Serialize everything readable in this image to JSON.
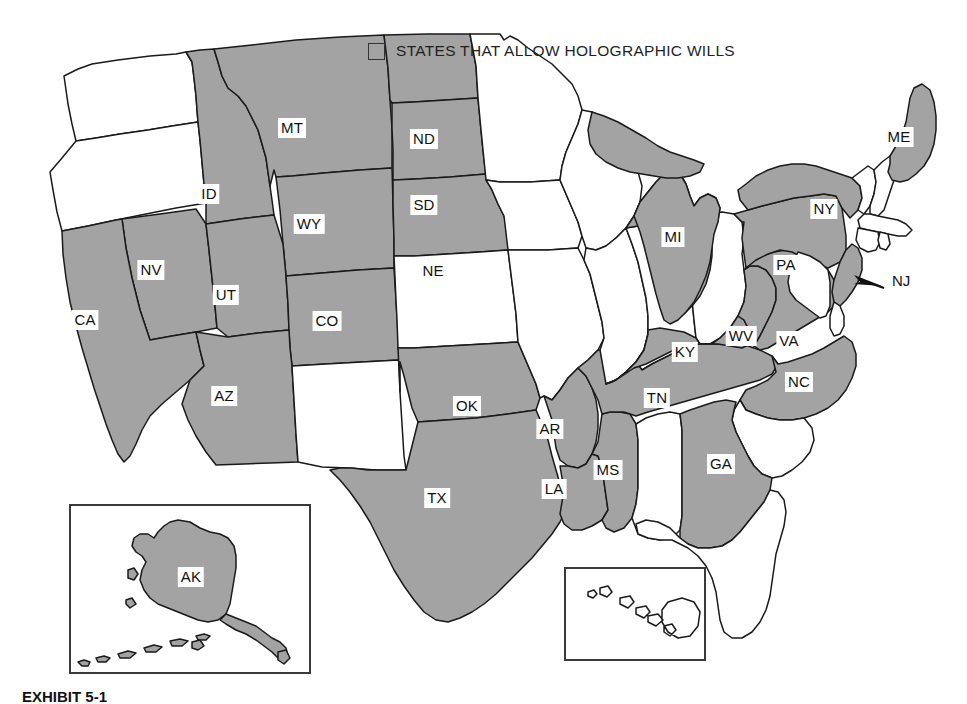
{
  "legend": {
    "swatch_icon": "filled-square-icon",
    "label": "STATES THAT ALLOW HOLOGRAPHIC WILLS",
    "shaded_color": "#a3a3a3",
    "plain_color": "#ffffff",
    "outline_color": "#1a1a1a"
  },
  "map": {
    "title": "United States map of states that allow holographic wills",
    "shaded_states": [
      "AK",
      "AZ",
      "AR",
      "CA",
      "CO",
      "GA",
      "ID",
      "KY",
      "LA",
      "ME",
      "MI",
      "MS",
      "MT",
      "NE",
      "NV",
      "NJ",
      "NY",
      "NC",
      "ND",
      "OK",
      "PA",
      "SD",
      "TN",
      "TX",
      "UT",
      "VA",
      "WV",
      "WY"
    ],
    "plain_states": [
      "AL",
      "CT",
      "DE",
      "FL",
      "HI",
      "IL",
      "IN",
      "IA",
      "KS",
      "MD",
      "MA",
      "MN",
      "MO",
      "NH",
      "NM",
      "OH",
      "OR",
      "RI",
      "SC",
      "VT",
      "WA",
      "WI"
    ],
    "labels": [
      {
        "code": "MT",
        "x": 292,
        "y": 128
      },
      {
        "code": "ND",
        "x": 424,
        "y": 139
      },
      {
        "code": "ID",
        "x": 209,
        "y": 194
      },
      {
        "code": "SD",
        "x": 424,
        "y": 205
      },
      {
        "code": "WY",
        "x": 309,
        "y": 224
      },
      {
        "code": "ME",
        "x": 899,
        "y": 137
      },
      {
        "code": "NY",
        "x": 824,
        "y": 209
      },
      {
        "code": "MI",
        "x": 673,
        "y": 237
      },
      {
        "code": "NE",
        "x": 433,
        "y": 271
      },
      {
        "code": "NV",
        "x": 151,
        "y": 270
      },
      {
        "code": "PA",
        "x": 786,
        "y": 265
      },
      {
        "code": "UT",
        "x": 226,
        "y": 295
      },
      {
        "code": "CA",
        "x": 85,
        "y": 320
      },
      {
        "code": "CO",
        "x": 327,
        "y": 321
      },
      {
        "code": "WV",
        "x": 741,
        "y": 336
      },
      {
        "code": "VA",
        "x": 789,
        "y": 341
      },
      {
        "code": "KY",
        "x": 685,
        "y": 352
      },
      {
        "code": "NC",
        "x": 799,
        "y": 382
      },
      {
        "code": "AZ",
        "x": 224,
        "y": 396
      },
      {
        "code": "OK",
        "x": 467,
        "y": 406
      },
      {
        "code": "TN",
        "x": 657,
        "y": 398
      },
      {
        "code": "AR",
        "x": 550,
        "y": 429
      },
      {
        "code": "MS",
        "x": 608,
        "y": 470
      },
      {
        "code": "GA",
        "x": 721,
        "y": 464
      },
      {
        "code": "LA",
        "x": 554,
        "y": 489
      },
      {
        "code": "TX",
        "x": 437,
        "y": 498
      },
      {
        "code": "AK",
        "x": 191,
        "y": 577
      }
    ],
    "callouts": [
      {
        "code": "NJ",
        "label": "NJ",
        "icon": "arrow-left-icon",
        "text_x": 880,
        "text_y": 291,
        "arrow_tip_x": 848,
        "arrow_tip_y": 282
      }
    ],
    "insets": [
      {
        "name": "alaska-inset",
        "label": "AK",
        "x": 70,
        "y": 505,
        "width": 240,
        "height": 168
      },
      {
        "name": "hawaii-inset",
        "label": "",
        "x": 565,
        "y": 568,
        "width": 140,
        "height": 92
      }
    ]
  },
  "caption": {
    "exhibit": "EXHIBIT 5-1",
    "rest": ""
  }
}
